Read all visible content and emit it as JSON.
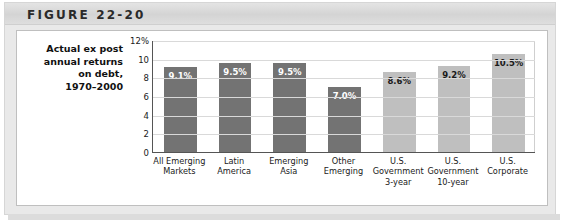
{
  "figure": {
    "title": "FIGURE 22-20",
    "caption_lines": [
      "Actual ex post",
      "annual returns",
      "on debt,",
      "1970–2000"
    ]
  },
  "colors": {
    "bar_dark": "#737373",
    "bar_light": "#bfbfbf",
    "header_band": "#dcdcdc",
    "panel_background": "#ffffff",
    "gridline": "#d9d9d9",
    "axis": "#555555"
  },
  "chart_data": {
    "type": "bar",
    "xlabel": "",
    "ylabel": "",
    "ylim": [
      0,
      12
    ],
    "ytick_labels": [
      "12%",
      "10",
      "8",
      "6",
      "4",
      "2",
      "0"
    ],
    "ytick_values": [
      12,
      10,
      8,
      6,
      4,
      2,
      0
    ],
    "grid": true,
    "legend": "none",
    "categories": [
      "All Emerging Markets",
      "Latin America",
      "Emerging Asia",
      "Other Emerging",
      "U.S. Government 3-year",
      "U.S. Government 10-year",
      "U.S. Corporate"
    ],
    "category_lines": [
      [
        "All Emerging",
        "Markets"
      ],
      [
        "Latin",
        "America"
      ],
      [
        "Emerging",
        "Asia"
      ],
      [
        "Other",
        "Emerging"
      ],
      [
        "U.S.",
        "Government",
        "3-year"
      ],
      [
        "U.S.",
        "Government",
        "10-year"
      ],
      [
        "U.S.",
        "Corporate"
      ]
    ],
    "values": [
      9.1,
      9.5,
      9.5,
      7.0,
      8.6,
      9.2,
      10.5
    ],
    "value_labels": [
      "9.1%",
      "9.5%",
      "9.5%",
      "7.0%",
      "8.6%",
      "9.2%",
      "10.5%"
    ],
    "bar_colors": [
      "#737373",
      "#737373",
      "#737373",
      "#737373",
      "#bfbfbf",
      "#bfbfbf",
      "#bfbfbf"
    ],
    "label_styles": [
      "on-dark",
      "on-dark",
      "on-dark",
      "on-dark",
      "on-light",
      "on-light",
      "on-light"
    ]
  }
}
